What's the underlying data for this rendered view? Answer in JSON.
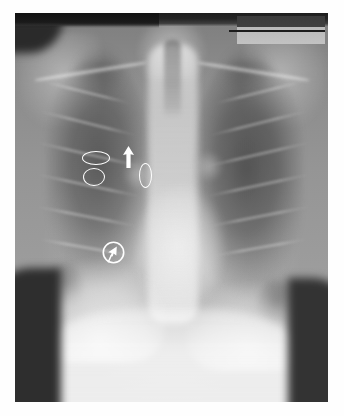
{
  "image": {
    "modality": "chest-radiograph",
    "view": "posteroanterior",
    "alt_text": "Posteroanterior chest radiograph with white annotation markers over the right upper and mid lung zone",
    "plate_border_color": "#ffffff",
    "background_color": "#ffffff"
  },
  "annotations": {
    "marker_color": "#ffffff",
    "items": [
      {
        "id": "marker-1",
        "shape": "horizontal-ellipse",
        "label": "right upper zone horizontal ellipse",
        "x": 67,
        "y": 138,
        "width": 28,
        "height": 14
      },
      {
        "id": "marker-2",
        "shape": "circle",
        "label": "right upper zone circle",
        "x": 68,
        "y": 155,
        "width": 22,
        "height": 18
      },
      {
        "id": "marker-3",
        "shape": "arrow-up",
        "label": "upward pointing arrow",
        "x": 107,
        "y": 133,
        "width": 13,
        "height": 22
      },
      {
        "id": "marker-4",
        "shape": "vertical-ellipse",
        "label": "paramediastinal vertical ellipse",
        "x": 124,
        "y": 150,
        "width": 13,
        "height": 25
      },
      {
        "id": "marker-5",
        "shape": "circled-cursor-arrow",
        "label": "circled diagonal arrow marker in right mid zone",
        "x": 86,
        "y": 228,
        "width": 25,
        "height": 25
      }
    ]
  },
  "film_features": {
    "top_exposure_band": "dark unexposed border strip",
    "collimation_box": "light gray collimation rectangle at top right",
    "regions": [
      "right lung field",
      "left lung field",
      "mediastinum",
      "cardiac silhouette",
      "right hemidiaphragm",
      "left hemidiaphragm",
      "clavicles",
      "rib cage",
      "upper abdomen"
    ]
  }
}
